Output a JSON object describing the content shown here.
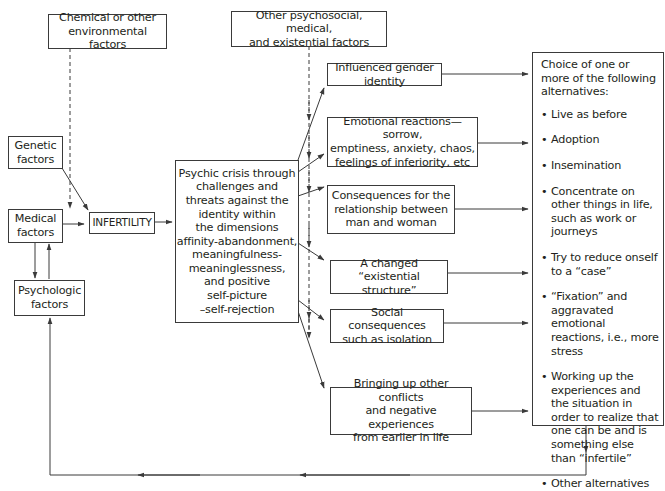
{
  "diagram": {
    "type": "flowchart",
    "nodes": {
      "chemical": {
        "label": "Chemical or other environmental factors",
        "lines": [
          "Chemical or other",
          "environmental factors"
        ]
      },
      "other_factors": {
        "label": "Other psychosocial, medical, and existential factors",
        "lines": [
          "Other psychosocial, medical,",
          "and existential factors"
        ]
      },
      "genetic": {
        "label": "Genetic factors",
        "lines": [
          "Genetic",
          "factors"
        ]
      },
      "medical": {
        "label": "Medical factors",
        "lines": [
          "Medical",
          "factors"
        ]
      },
      "psychologic": {
        "label": "Psychologic factors",
        "lines": [
          "Psychologic",
          "factors"
        ]
      },
      "infertility": {
        "label": "INFERTILITY"
      },
      "crisis": {
        "label": "Psychic crisis through challenges and threats against the identity within the dimensions affinity-abandonment, meaningfulness-meaninglessness, and positive self-picture –self-rejection",
        "lines": [
          "Psychic crisis through",
          "challenges and",
          "threats against the",
          "identity within",
          "the dimensions",
          "affinity-abandonment,",
          "meaningfulness-",
          "meaninglessness,",
          "and positive",
          "self-picture",
          "–self-rejection"
        ]
      },
      "gender": {
        "label": "Influenced gender identity"
      },
      "emotional": {
        "label": "Emotional reactions—sorrow, emptiness, anxiety, chaos, feelings of inferiority, etc",
        "lines": [
          "Emotional reactions—sorrow,",
          "emptiness, anxiety, chaos,",
          "feelings of inferiority, etc"
        ]
      },
      "relationship": {
        "label": "Consequences for the relationship between man and woman",
        "lines": [
          "Consequences for the",
          "relationship between",
          "man and woman"
        ]
      },
      "existential": {
        "label": "A changed “existential structure”",
        "lines": [
          "A changed “existential",
          "structure”"
        ]
      },
      "social": {
        "label": "Social consequences such as isolation",
        "lines": [
          "Social consequences",
          "such as isolation"
        ]
      },
      "conflicts": {
        "label": "Bringing up other conflicts and negative experiences from earlier in life",
        "lines": [
          "Bringing up other conflicts",
          "and negative experiences",
          "from earlier in life"
        ]
      },
      "choice": {
        "heading": "Choice of one or more of the following alternatives:",
        "items": [
          "Live as before",
          "Adoption",
          "Insemination",
          "Concentrate on other things in life, such as work or journeys",
          "Try to reduce onself to a “case”",
          "“Fixation” and aggravated emotional reactions, i.e., more stress",
          "Working up the experiences and the situation in order to realize that one can be and is something else than “infertile”",
          "Other alternatives"
        ]
      }
    },
    "edges": [
      {
        "from": "chemical",
        "to": "infertility",
        "style": "dashed"
      },
      {
        "from": "genetic",
        "to": "infertility",
        "style": "solid"
      },
      {
        "from": "medical",
        "to": "infertility",
        "style": "solid"
      },
      {
        "from": "medical",
        "to": "psychologic",
        "style": "solid"
      },
      {
        "from": "psychologic",
        "to": "medical",
        "style": "solid"
      },
      {
        "from": "infertility",
        "to": "crisis",
        "style": "solid"
      },
      {
        "from": "other_factors",
        "to": "crisis-outcomes",
        "style": "dashed"
      },
      {
        "from": "crisis",
        "to": "gender",
        "style": "solid"
      },
      {
        "from": "crisis",
        "to": "emotional",
        "style": "solid"
      },
      {
        "from": "crisis",
        "to": "relationship",
        "style": "solid"
      },
      {
        "from": "crisis",
        "to": "existential",
        "style": "solid"
      },
      {
        "from": "crisis",
        "to": "social",
        "style": "solid"
      },
      {
        "from": "crisis",
        "to": "conflicts",
        "style": "solid"
      },
      {
        "from": "gender",
        "to": "choice",
        "style": "solid"
      },
      {
        "from": "emotional",
        "to": "choice",
        "style": "solid"
      },
      {
        "from": "relationship",
        "to": "choice",
        "style": "solid"
      },
      {
        "from": "existential",
        "to": "choice",
        "style": "solid"
      },
      {
        "from": "social",
        "to": "choice",
        "style": "solid"
      },
      {
        "from": "conflicts",
        "to": "choice",
        "style": "solid"
      },
      {
        "from": "choice",
        "to": "psychologic",
        "style": "solid",
        "note": "feedback loop along bottom"
      }
    ],
    "colors": {
      "line": "#3a3a3a",
      "text": "#231f20",
      "background": "#ffffff"
    }
  }
}
